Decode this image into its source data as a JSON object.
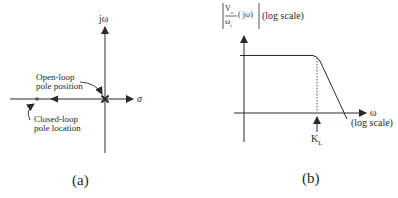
{
  "panel_a": {
    "caption": "(a)",
    "y_axis_label": "jω",
    "x_axis_label": "σ",
    "open_loop_label_line1": "Open-loop",
    "open_loop_label_line2": "pole position",
    "closed_loop_label_line1": "Closed-loop",
    "closed_loop_label_line2": "pole location"
  },
  "panel_b": {
    "caption": "(b)",
    "y_axis_label_num": "V",
    "y_axis_label_num_sub": "o",
    "y_axis_label_den": "ω",
    "y_axis_label_den_sub": "i",
    "y_axis_label_arg": "( jω)",
    "y_axis_label_scale": "(log scale)",
    "x_axis_label": "ω",
    "x_axis_scale": "(log scale)",
    "marker_label": "K",
    "marker_label_sub": "L"
  },
  "colors": {
    "line": "#2a2a2a",
    "background": "#ffffff"
  }
}
